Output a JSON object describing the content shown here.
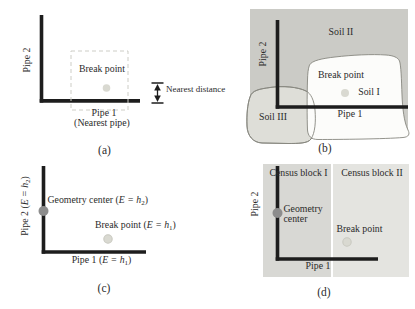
{
  "colors": {
    "pipe": "#1d1d1d",
    "text": "#2b2b2b",
    "soil_bg": "#cbcbc6",
    "soil1_fill": "#fcfcfa",
    "soil3_fill": "#deded8",
    "outline": "#87877f",
    "dash": "#cdcdc6",
    "census_block_1": "#d8d8d4",
    "census_block_2": "#e4e4e0",
    "geometry_center_dot": "#8d8d8d",
    "break_point_dot": "#d9d9d1",
    "break_point_ring": "#c9c9c0"
  },
  "panels": {
    "a": {
      "caption": "(a)",
      "pipe2_label": "Pipe 2",
      "break_point_label": "Break point",
      "pipe1_label": "Pipe 1",
      "pipe1_sublabel": "(Nearest pipe)",
      "nearest_distance_label": "Nearest distance"
    },
    "b": {
      "caption": "(b)",
      "pipe2_label": "Pipe 2",
      "pipe1_label": "Pipe 1",
      "soil2_label": "Soil II",
      "break_point_label": "Break point",
      "soil1_label": "Soil I",
      "soil3_label": "Soil III"
    },
    "c": {
      "caption": "(c)",
      "pipe2_label": {
        "pre": "Pipe 2 (",
        "math": "E = h",
        "sub": "2",
        "post": ")"
      },
      "geometry_center_label": {
        "pre": "Geometry center (",
        "math": "E = h",
        "sub": "2",
        "post": ")"
      },
      "break_point_label": {
        "pre": "Break point (",
        "math": "E = h",
        "sub": "1",
        "post": ")"
      },
      "pipe1_label": {
        "pre": "Pipe 1 (",
        "math": "E = h",
        "sub": "1",
        "post": ")"
      }
    },
    "d": {
      "caption": "(d)",
      "census_block_1_label": "Census block I",
      "census_block_2_label": "Census block II",
      "pipe2_label": "Pipe 2",
      "geometry_center_line1": "Geometry",
      "geometry_center_line2": "center",
      "break_point_label": "Break point",
      "pipe1_label": "Pipe 1"
    }
  }
}
